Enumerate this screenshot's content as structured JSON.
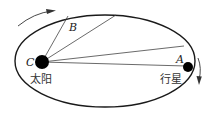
{
  "diagram": {
    "type": "kepler-orbit",
    "orbit": {
      "cx": 105,
      "cy": 61,
      "rx": 90,
      "ry": 46,
      "stroke": "#1a1a1a"
    },
    "sun": {
      "x": 42,
      "y": 62,
      "r": 7,
      "label_point": "C",
      "label_name": "太阳",
      "color": "#000000"
    },
    "planet": {
      "x": 188,
      "y": 67,
      "r": 5,
      "label_point": "A",
      "label_name": "行星",
      "color": "#000000"
    },
    "point_b": {
      "label": "B"
    },
    "radius_lines": [
      {
        "x2": 68,
        "y2": 16
      },
      {
        "x2": 116,
        "y2": 15
      },
      {
        "x2": 184,
        "y2": 46
      },
      {
        "x2": 186,
        "y2": 66
      }
    ],
    "direction_arrows": [
      {
        "name": "top-left",
        "direction": "clockwise"
      },
      {
        "name": "right",
        "direction": "clockwise"
      }
    ]
  }
}
